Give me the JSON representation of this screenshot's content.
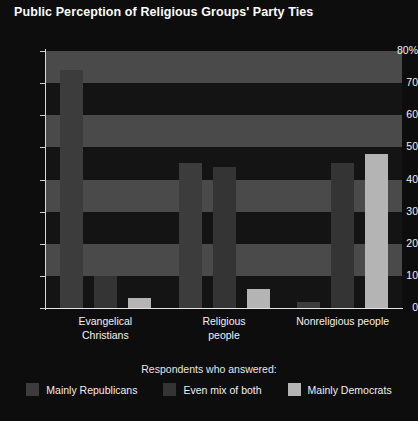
{
  "chart_data": {
    "type": "bar",
    "title": "Public Perception of Religious Groups' Party Ties",
    "xlabel": "",
    "ylabel": "",
    "ylim": [
      0,
      80
    ],
    "yticks": [
      0,
      10,
      20,
      30,
      40,
      50,
      60,
      70,
      80
    ],
    "ytick_labels": [
      "0",
      "10",
      "20",
      "30",
      "40",
      "50",
      "60",
      "70",
      "80%"
    ],
    "grid": false,
    "banded_background": true,
    "legend_position": "bottom",
    "legend_title": "Respondents who answered:",
    "categories": [
      "Evangelical Christians",
      "Religious people",
      "Nonreligious people"
    ],
    "category_lines": [
      [
        "Evangelical",
        "Christians"
      ],
      [
        "Religious",
        "people"
      ],
      [
        "Nonreligious people"
      ]
    ],
    "series": [
      {
        "name": "Mainly Republicans",
        "color": "#3c3c3c",
        "values": [
          74,
          45,
          2
        ]
      },
      {
        "name": "Even mix of both",
        "color": "#343434",
        "values": [
          10,
          44,
          45
        ]
      },
      {
        "name": "Mainly Democrats",
        "color": "#b4b4b4",
        "values": [
          3,
          6,
          48
        ]
      }
    ]
  },
  "colors": {
    "background": "#0d0d0d",
    "band_light": "#4a4a4a",
    "band_dark": "#141414",
    "axis": "#e0e0e0",
    "text": "#f0f0f0"
  }
}
